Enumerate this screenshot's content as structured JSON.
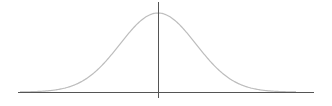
{
  "chart_data": {
    "type": "line",
    "title": "",
    "subtitle": "",
    "xlabel": "",
    "ylabel": "",
    "series": [
      {
        "name": "normal-density",
        "distribution": "normal",
        "mean": 0,
        "std": 1,
        "x": [
          -3.5,
          -3,
          -2.5,
          -2,
          -1.5,
          -1,
          -0.5,
          0,
          0.5,
          1,
          1.5,
          2,
          2.5,
          3,
          3.5
        ],
        "values": [
          0.0009,
          0.0044,
          0.0175,
          0.054,
          0.1295,
          0.242,
          0.3521,
          0.3989,
          0.3521,
          0.242,
          0.1295,
          0.054,
          0.0175,
          0.0044,
          0.0009
        ]
      }
    ],
    "xlim": [
      -4,
      4
    ],
    "ylim": [
      0,
      0.42
    ],
    "grid": false,
    "legend": null,
    "tick_labels": {
      "x": [],
      "y": []
    },
    "colors": {
      "curve": "#bdbdbd",
      "axes": "#555555",
      "background": "#ffffff"
    }
  },
  "layout": {
    "axis_y_px": 92,
    "axis_x_start_px": 18,
    "axis_x_end_px": 314,
    "center_x_px": 158,
    "peak_y_px": 13,
    "std_px": 38
  }
}
